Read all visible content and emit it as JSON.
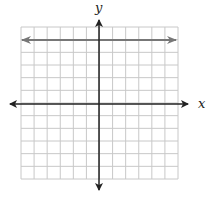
{
  "diagram": {
    "type": "coordinate-plane",
    "axis_labels": {
      "x": "x",
      "y": "y"
    },
    "grid": {
      "columns": 12,
      "rows": 12,
      "left": 21,
      "top": 27,
      "right": 178,
      "bottom": 179
    },
    "axes": {
      "origin_px": [
        99,
        104
      ],
      "color": "#222222"
    },
    "graphed_line": {
      "description": "horizontal line with arrows at both ends",
      "grid_y_units_above_x_axis": 5,
      "y_px": 40,
      "x_from_px": 22,
      "x_to_px": 176,
      "color": "#777777"
    },
    "colors": {
      "grid": "#c8c8c8",
      "axes": "#222222",
      "line": "#777777",
      "background": "#ffffff"
    }
  }
}
